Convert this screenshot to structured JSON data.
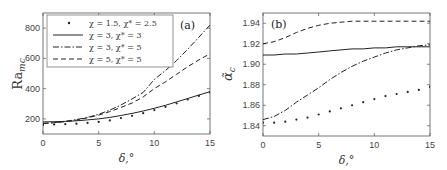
{
  "chart_data": [
    {
      "type": "line",
      "panel_label": "(a)",
      "xlabel": "δ,°",
      "ylabel": "Ra_mc",
      "xlim": [
        0,
        15
      ],
      "ylim": [
        100,
        900
      ],
      "xticks": [
        "0",
        "5",
        "10",
        "15"
      ],
      "yticks": [
        "200",
        "400",
        "600",
        "800"
      ],
      "grid": false,
      "legend_position": "upper left",
      "x": [
        0,
        1,
        2,
        3,
        4,
        5,
        6,
        7,
        8,
        9,
        10,
        11,
        12,
        13,
        14,
        15
      ],
      "series": [
        {
          "name": "χ = 1.5, χ* = 2.5",
          "style": "dotted-markers",
          "values": [
            160,
            162,
            165,
            168,
            173,
            180,
            190,
            205,
            220,
            238,
            258,
            280,
            303,
            328,
            352,
            375
          ]
        },
        {
          "name": "χ = 3, χ* = 3",
          "style": "solid",
          "values": [
            180,
            181,
            183,
            187,
            193,
            200,
            210,
            222,
            236,
            252,
            270,
            290,
            312,
            335,
            358,
            380
          ]
        },
        {
          "name": "χ = 3, χ* = 5",
          "style": "dash-dot",
          "values": [
            170,
            175,
            183,
            195,
            210,
            230,
            258,
            292,
            332,
            375,
            460,
            520,
            585,
            660,
            740,
            820
          ]
        },
        {
          "name": "χ = 5, χ* = 5",
          "style": "dashed",
          "values": [
            170,
            174,
            181,
            192,
            207,
            225,
            248,
            275,
            305,
            345,
            400,
            445,
            495,
            545,
            590,
            630
          ]
        }
      ]
    },
    {
      "type": "line",
      "panel_label": "(b)",
      "xlabel": "δ,°",
      "ylabel": "α̃_c",
      "xlim": [
        0,
        15
      ],
      "ylim": [
        1.83,
        1.95
      ],
      "xticks": [
        "0",
        "5",
        "10",
        "15"
      ],
      "yticks": [
        "1.84",
        "1.86",
        "1.88",
        "1.90",
        "1.92",
        "1.94"
      ],
      "grid": false,
      "x": [
        0,
        1,
        2,
        3,
        4,
        5,
        6,
        7,
        8,
        9,
        10,
        11,
        12,
        13,
        14,
        15
      ],
      "series": [
        {
          "name": "χ = 1.5, χ* = 2.5",
          "style": "dotted-markers",
          "values": [
            1.843,
            1.843,
            1.844,
            1.846,
            1.848,
            1.851,
            1.854,
            1.857,
            1.86,
            1.863,
            1.866,
            1.869,
            1.871,
            1.873,
            1.875,
            1.878
          ]
        },
        {
          "name": "χ = 3, χ* = 3",
          "style": "solid",
          "values": [
            1.909,
            1.909,
            1.91,
            1.91,
            1.911,
            1.912,
            1.913,
            1.914,
            1.915,
            1.915,
            1.916,
            1.916,
            1.917,
            1.917,
            1.917,
            1.917
          ]
        },
        {
          "name": "χ = 3, χ* = 5",
          "style": "dash-dot",
          "values": [
            1.846,
            1.849,
            1.855,
            1.863,
            1.87,
            1.877,
            1.885,
            1.892,
            1.898,
            1.903,
            1.907,
            1.911,
            1.914,
            1.916,
            1.918,
            1.919
          ]
        },
        {
          "name": "χ = 5, χ* = 5",
          "style": "dashed",
          "values": [
            1.92,
            1.922,
            1.926,
            1.931,
            1.935,
            1.938,
            1.94,
            1.941,
            1.942,
            1.942,
            1.942,
            1.942,
            1.942,
            1.942,
            1.942,
            1.942
          ]
        }
      ]
    }
  ],
  "legend": {
    "entries": [
      "χ = 1.5, χ* = 2.5",
      "χ = 3, χ* = 3",
      "χ = 3, χ* = 5",
      "χ = 5, χ* = 5"
    ]
  }
}
